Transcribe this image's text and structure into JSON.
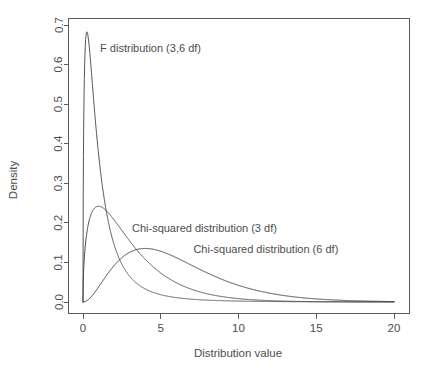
{
  "chart_data": {
    "type": "line",
    "title": "",
    "xlabel": "Distribution value",
    "ylabel": "Density",
    "xlim": [
      0,
      20
    ],
    "ylim": [
      0,
      0.7
    ],
    "xticks": [
      0,
      5,
      10,
      15,
      20
    ],
    "xtick_labels": [
      "0",
      "5",
      "10",
      "15",
      "20"
    ],
    "yticks": [
      0.0,
      0.1,
      0.2,
      0.3,
      0.4,
      0.5,
      0.6,
      0.7
    ],
    "ytick_labels": [
      "0.0",
      "0.1",
      "0.2",
      "0.3",
      "0.4",
      "0.5",
      "0.6",
      "0.7"
    ],
    "grid": false,
    "legend_position": "inline-annotations",
    "background": "#ffffff",
    "series": [
      {
        "name": "F distribution (3,6 df)",
        "distribution": "F",
        "df1": 3,
        "df2": 6,
        "color": "#555555",
        "peak_x": 0.12,
        "peak_y": 0.672,
        "annotation": {
          "text": "F distribution (3,6 df)",
          "x": 1.1,
          "y": 0.632
        },
        "points": [
          {
            "x": 0.0,
            "y": 0.0
          },
          {
            "x": 0.05,
            "y": 0.553
          },
          {
            "x": 0.1,
            "y": 0.667
          },
          {
            "x": 0.15,
            "y": 0.671
          },
          {
            "x": 0.2,
            "y": 0.644
          },
          {
            "x": 0.3,
            "y": 0.572
          },
          {
            "x": 0.5,
            "y": 0.447
          },
          {
            "x": 0.75,
            "y": 0.338
          },
          {
            "x": 1.0,
            "y": 0.261
          },
          {
            "x": 1.5,
            "y": 0.163
          },
          {
            "x": 2.0,
            "y": 0.107
          },
          {
            "x": 2.5,
            "y": 0.073
          },
          {
            "x": 3.0,
            "y": 0.051
          },
          {
            "x": 4.0,
            "y": 0.027
          },
          {
            "x": 5.0,
            "y": 0.016
          },
          {
            "x": 6.0,
            "y": 0.01
          },
          {
            "x": 8.0,
            "y": 0.005
          },
          {
            "x": 10.0,
            "y": 0.003
          },
          {
            "x": 15.0,
            "y": 0.001
          },
          {
            "x": 20.0,
            "y": 0.0005
          }
        ]
      },
      {
        "name": "Chi-squared distribution (3 df)",
        "distribution": "chi-squared",
        "df": 3,
        "color": "#4a4a4a",
        "peak_x": 1.0,
        "peak_y": 0.242,
        "annotation": {
          "text": "Chi-squared distribution (3 df)",
          "x": 3.15,
          "y": 0.178
        },
        "points": [
          {
            "x": 0.0,
            "y": 0.0
          },
          {
            "x": 0.25,
            "y": 0.171
          },
          {
            "x": 0.5,
            "y": 0.22
          },
          {
            "x": 0.75,
            "y": 0.237
          },
          {
            "x": 1.0,
            "y": 0.242
          },
          {
            "x": 1.5,
            "y": 0.232
          },
          {
            "x": 2.0,
            "y": 0.207
          },
          {
            "x": 3.0,
            "y": 0.154
          },
          {
            "x": 4.0,
            "y": 0.108
          },
          {
            "x": 5.0,
            "y": 0.073
          },
          {
            "x": 6.0,
            "y": 0.049
          },
          {
            "x": 8.0,
            "y": 0.021
          },
          {
            "x": 10.0,
            "y": 0.0085
          },
          {
            "x": 12.0,
            "y": 0.0034
          },
          {
            "x": 15.0,
            "y": 0.00085
          },
          {
            "x": 20.0,
            "y": 7e-05
          }
        ]
      },
      {
        "name": "Chi-squared distribution (6 df)",
        "distribution": "chi-squared",
        "df": 6,
        "color": "#3c3c3c",
        "peak_x": 4.0,
        "peak_y": 0.135,
        "annotation": {
          "text": "Chi-squared distribution (6 df)",
          "x": 7.1,
          "y": 0.125
        },
        "points": [
          {
            "x": 0.0,
            "y": 0.0
          },
          {
            "x": 0.5,
            "y": 0.0122
          },
          {
            "x": 1.0,
            "y": 0.038
          },
          {
            "x": 2.0,
            "y": 0.092
          },
          {
            "x": 3.0,
            "y": 0.1255
          },
          {
            "x": 4.0,
            "y": 0.1353
          },
          {
            "x": 5.0,
            "y": 0.1282
          },
          {
            "x": 6.0,
            "y": 0.112
          },
          {
            "x": 8.0,
            "y": 0.0733
          },
          {
            "x": 10.0,
            "y": 0.0421
          },
          {
            "x": 12.0,
            "y": 0.0223
          },
          {
            "x": 14.0,
            "y": 0.0111
          },
          {
            "x": 16.0,
            "y": 0.0053
          },
          {
            "x": 18.0,
            "y": 0.0025
          },
          {
            "x": 20.0,
            "y": 0.0011
          }
        ]
      }
    ]
  },
  "axes": {
    "x_title": "Distribution value",
    "y_title": "Density"
  }
}
